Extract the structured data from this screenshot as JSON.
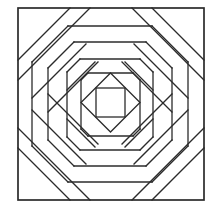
{
  "diagram": {
    "title": "",
    "stroke_color": "#2b2b2b",
    "stroke_width": 1.3,
    "background": "#ffffff",
    "border": {
      "x": 18,
      "y": 8,
      "w": 186,
      "h": 192
    },
    "center_square": {
      "x": 96,
      "y": 88,
      "w": 29,
      "h": 29
    },
    "diamond": [
      [
        110.5,
        73
      ],
      [
        140,
        102.5
      ],
      [
        110.5,
        132
      ],
      [
        81,
        102.5
      ]
    ],
    "lines": [
      [
        18,
        60,
        70,
        8
      ],
      [
        18,
        80,
        90,
        8
      ],
      [
        152,
        8,
        204,
        60
      ],
      [
        132,
        8,
        204,
        80
      ],
      [
        18,
        148,
        70,
        200
      ],
      [
        18,
        128,
        90,
        200
      ],
      [
        152,
        200,
        204,
        148
      ],
      [
        132,
        200,
        204,
        128
      ],
      [
        68,
        26,
        152,
        26
      ],
      [
        32,
        62,
        68,
        26
      ],
      [
        152,
        26,
        188,
        62
      ],
      [
        68,
        182,
        152,
        182
      ],
      [
        32,
        146,
        68,
        182
      ],
      [
        152,
        182,
        188,
        146
      ],
      [
        32,
        62,
        32,
        146
      ],
      [
        188,
        62,
        188,
        146
      ],
      [
        32,
        98,
        86,
        44
      ],
      [
        134,
        44,
        188,
        98
      ],
      [
        32,
        110,
        86,
        164
      ],
      [
        134,
        164,
        188,
        110
      ],
      [
        74,
        42,
        146,
        42
      ],
      [
        74,
        166,
        146,
        166
      ],
      [
        48,
        68,
        74,
        42
      ],
      [
        146,
        42,
        172,
        68
      ],
      [
        48,
        140,
        74,
        166
      ],
      [
        146,
        166,
        172,
        140
      ],
      [
        48,
        68,
        48,
        140
      ],
      [
        172,
        68,
        172,
        140
      ],
      [
        48,
        112,
        98,
        62
      ],
      [
        122,
        62,
        172,
        112
      ],
      [
        48,
        94,
        98,
        144
      ],
      [
        122,
        144,
        172,
        94
      ],
      [
        80,
        59,
        140,
        59
      ],
      [
        80,
        150,
        140,
        150
      ],
      [
        67,
        72,
        80,
        59
      ],
      [
        140,
        59,
        153,
        72
      ],
      [
        67,
        137,
        80,
        150
      ],
      [
        140,
        150,
        153,
        137
      ],
      [
        67,
        72,
        67,
        137
      ],
      [
        153,
        72,
        153,
        137
      ],
      [
        67,
        90,
        95,
        62
      ],
      [
        125,
        62,
        153,
        90
      ],
      [
        67,
        119,
        95,
        147
      ],
      [
        125,
        147,
        153,
        119
      ],
      [
        88,
        73,
        133,
        73
      ],
      [
        88,
        136,
        133,
        136
      ],
      [
        81,
        80,
        88,
        73
      ],
      [
        133,
        73,
        140,
        80
      ],
      [
        81,
        129,
        88,
        136
      ],
      [
        133,
        136,
        140,
        129
      ],
      [
        81,
        80,
        81,
        129
      ],
      [
        140,
        80,
        140,
        129
      ]
    ]
  }
}
